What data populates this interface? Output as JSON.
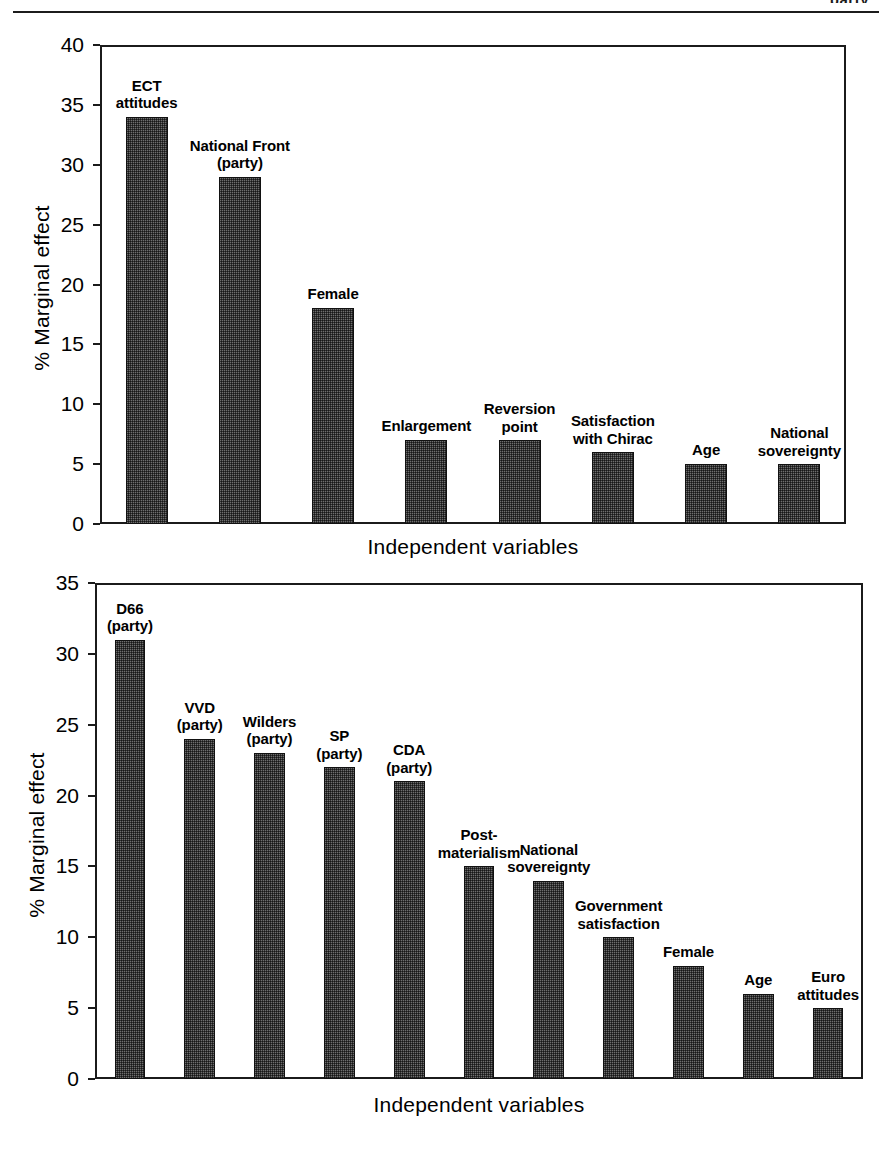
{
  "header": {
    "clipped_text": "party",
    "rule": "horizontal-rule"
  },
  "chart_data": [
    {
      "id": "france",
      "type": "bar",
      "title": "",
      "xlabel": "Independent variables",
      "ylabel": "% Marginal effect",
      "ylim": [
        0,
        40
      ],
      "yticks": [
        0,
        5,
        10,
        15,
        20,
        25,
        30,
        35,
        40
      ],
      "ytick_labels": [
        "0",
        "5",
        "10",
        "15",
        "20",
        "25",
        "30",
        "35",
        "40"
      ],
      "grid": false,
      "legend": "none",
      "categories": [
        "ECT\nattitudes",
        "National Front\n(party)",
        "Female",
        "Enlargement",
        "Reversion\npoint",
        "Satisfaction\nwith Chirac",
        "Age",
        "National\nsovereignty"
      ],
      "values": [
        34,
        29,
        18,
        7,
        7,
        6,
        5,
        5
      ]
    },
    {
      "id": "netherlands",
      "type": "bar",
      "title": "",
      "xlabel": "Independent variables",
      "ylabel": "% Marginal effect",
      "ylim": [
        0,
        35
      ],
      "yticks": [
        0,
        5,
        10,
        15,
        20,
        25,
        30,
        35
      ],
      "ytick_labels": [
        "0",
        "5",
        "10",
        "15",
        "20",
        "25",
        "30",
        "35"
      ],
      "grid": false,
      "legend": "none",
      "categories": [
        "D66\n(party)",
        "VVD\n(party)",
        "Wilders\n(party)",
        "SP\n(party)",
        "CDA\n(party)",
        "Post-\nmaterialism",
        "National\nsovereignty",
        "Government\nsatisfaction",
        "Female",
        "Age",
        "Euro\nattitudes"
      ],
      "values": [
        31,
        24,
        23,
        22,
        21,
        15,
        14,
        10,
        8,
        6,
        5
      ]
    }
  ],
  "colors": {
    "bar_fill": "#6e6e6e",
    "bar_stroke": "#111111",
    "axis": "#1b1b1b",
    "text": "#000000",
    "background": "#ffffff"
  }
}
